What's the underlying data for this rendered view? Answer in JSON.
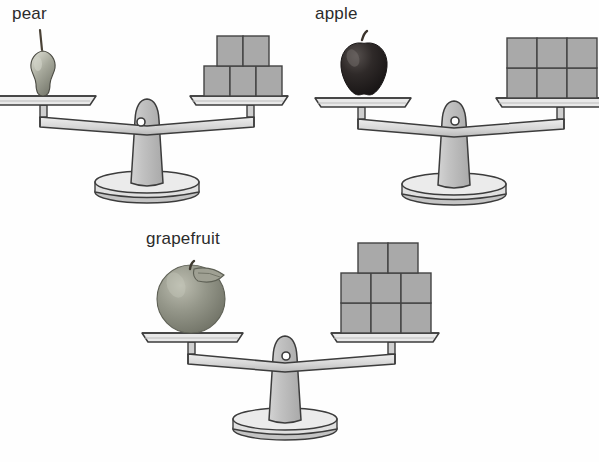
{
  "page": {
    "kind": "math-worksheet-balance-scales",
    "background_color": "#fefefe",
    "width": 599,
    "height": 462
  },
  "palette": {
    "outline": "#3c3c3c",
    "cube_face": "#a9a9a9",
    "cube_outline": "#434343",
    "scale_light": "#e3e3e3",
    "scale_mid": "#c9c9c9",
    "scale_shadow": "#b4b4b4",
    "pear_color": "#9a9c8f",
    "apple_color": "#2e2a2a",
    "grapefruit_color": "#8e9082",
    "text_color": "#2b2b2b"
  },
  "balances": [
    {
      "id": "pear",
      "label": "pear",
      "fruit_icon": "pear-icon",
      "tilt": "level",
      "left_pan_contents": "pear",
      "right_pan_contents": "unit-cubes",
      "cube_count": 5,
      "cube_rows": [
        {
          "row": "top",
          "count": 2
        },
        {
          "row": "bottom",
          "count": 3
        }
      ],
      "left_pan_cut_off": true
    },
    {
      "id": "apple",
      "label": "apple",
      "fruit_icon": "apple-icon",
      "tilt": "level",
      "left_pan_contents": "apple",
      "right_pan_contents": "unit-cubes",
      "cube_count": 6,
      "cube_rows": [
        {
          "row": "top",
          "count": 3
        },
        {
          "row": "bottom",
          "count": 3
        }
      ],
      "right_pan_cut_off": true
    },
    {
      "id": "grapefruit",
      "label": "grapefruit",
      "fruit_icon": "grapefruit-icon",
      "tilt": "level",
      "left_pan_contents": "grapefruit",
      "right_pan_contents": "unit-cubes",
      "cube_count": 8,
      "cube_rows": [
        {
          "row": "top",
          "count": 2
        },
        {
          "row": "middle",
          "count": 3
        },
        {
          "row": "bottom",
          "count": 3
        }
      ]
    }
  ],
  "footer": {
    "partial_text": "..."
  }
}
